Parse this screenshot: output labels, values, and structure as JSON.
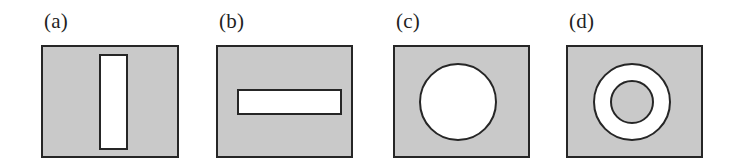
{
  "figure": {
    "background_color": "#ffffff",
    "fill_color": "#c9c9c9",
    "shape_color": "#ffffff",
    "stroke_color": "#262626",
    "stroke_width_px": 2
  },
  "panels": [
    {
      "label": "(a)",
      "shape_name": "vertical-slot",
      "box": {
        "x": 41,
        "y": 45,
        "width": 138,
        "height": 113
      },
      "label_pos": {
        "x": 44,
        "y": 11
      },
      "shape": {
        "type": "rect",
        "x": 99,
        "y": 54,
        "width": 29,
        "height": 96
      }
    },
    {
      "label": "(b)",
      "shape_name": "horizontal-slot",
      "box": {
        "x": 216,
        "y": 45,
        "width": 137,
        "height": 113
      },
      "label_pos": {
        "x": 219,
        "y": 11
      },
      "shape": {
        "type": "rect",
        "x": 237,
        "y": 89,
        "width": 105,
        "height": 26
      }
    },
    {
      "label": "(c)",
      "shape_name": "circular-hole",
      "box": {
        "x": 393,
        "y": 45,
        "width": 137,
        "height": 113
      },
      "label_pos": {
        "x": 396,
        "y": 11
      },
      "shape": {
        "type": "circle",
        "cx": 458,
        "cy": 102,
        "r": 39
      }
    },
    {
      "label": "(d)",
      "shape_name": "annular-ring",
      "box": {
        "x": 566,
        "y": 45,
        "width": 137,
        "height": 113
      },
      "label_pos": {
        "x": 569,
        "y": 11
      },
      "shape": {
        "type": "annulus",
        "cx": 632,
        "cy": 102,
        "r_outer": 39,
        "r_inner": 22
      }
    }
  ]
}
